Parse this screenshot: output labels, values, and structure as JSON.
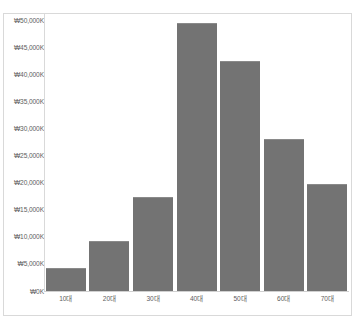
{
  "chart_data": {
    "type": "bar",
    "title": "",
    "xlabel": "",
    "ylabel": "",
    "categories": [
      "10대",
      "20대",
      "30대",
      "40대",
      "50대",
      "60대",
      "70대"
    ],
    "values": [
      4200,
      9200,
      17300,
      49400,
      42400,
      28000,
      19700
    ],
    "series": [
      {
        "name": "",
        "values": [
          4200,
          9200,
          17300,
          49400,
          42400,
          28000,
          19700
        ]
      }
    ],
    "ylim": [
      0,
      50000
    ],
    "y_tick_values": [
      0,
      5000,
      10000,
      15000,
      20000,
      25000,
      30000,
      35000,
      40000,
      45000,
      50000
    ],
    "y_tick_labels": [
      "₩0K",
      "₩5,000K",
      "₩10,000K",
      "₩15,000K",
      "₩20,000K",
      "₩25,000K",
      "₩30,000K",
      "₩35,000K",
      "₩40,000K",
      "₩45,000K",
      "₩50,000K"
    ],
    "grid": false,
    "legend": false,
    "legend_position": "none",
    "bar_color": "#737373",
    "bar_border_color": "#8a8a8a",
    "axis_line_color": "#d9d9d9",
    "tick_label_color": "#5e5e5e",
    "plot_background": "#ffffff",
    "frame_border_color": "#d9d9d9"
  },
  "figure": {
    "title_text": "",
    "title_clipped": true
  }
}
